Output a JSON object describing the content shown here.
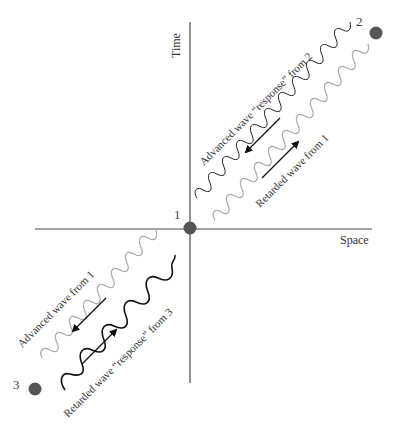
{
  "diagram": {
    "axes": {
      "vertical_label": "Time",
      "horizontal_label": "Space",
      "color": "#4a4a4a"
    },
    "points": [
      {
        "id": "1",
        "label": "1",
        "x": 190,
        "y": 228,
        "label_x": 176,
        "label_y": 219
      },
      {
        "id": "2",
        "label": "2",
        "x": 376,
        "y": 33,
        "label_x": 358,
        "label_y": 26
      },
      {
        "id": "3",
        "label": "3",
        "x": 35,
        "y": 389,
        "label_x": 14,
        "label_y": 390
      }
    ],
    "point_color": "#555555",
    "waves": [
      {
        "id": "advanced-response-from-2",
        "label": "Advanced wave “response” from 2",
        "color": "#222222"
      },
      {
        "id": "retarded-from-1",
        "label": "Retarded wave from 1",
        "color": "#a8a8a8"
      },
      {
        "id": "advanced-from-1",
        "label": "Advanced wave from 1",
        "color": "#a8a8a8"
      },
      {
        "id": "retarded-response-from-3",
        "label": "Retarded wave “response” from 3",
        "color": "#111111"
      }
    ],
    "text_color": "#333333"
  }
}
